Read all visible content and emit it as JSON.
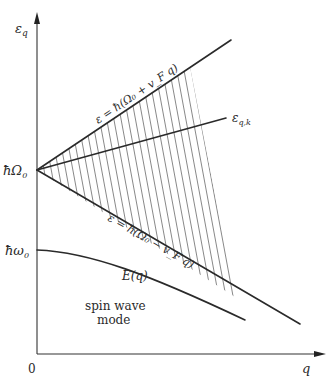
{
  "figure": {
    "type": "energy spectrum diagram",
    "axes": {
      "y_label": "ε_q",
      "x_label": "q",
      "origin_label": "0"
    },
    "y_ticks": [
      {
        "label": "ħΩ₀",
        "y_px": 170
      },
      {
        "label": "ħω₀",
        "y_px": 250
      }
    ],
    "curves": [
      {
        "name": "upper-boundary",
        "label": "ε = ħ(Ω₀ + v_F q)",
        "from": [
          37,
          170
        ],
        "to": [
          231,
          40
        ]
      },
      {
        "name": "eps-qk",
        "label": "ε_{q,k}",
        "from": [
          37,
          170
        ],
        "to": [
          226,
          118
        ]
      },
      {
        "name": "lower-boundary",
        "label": "ε = ħ(Ω₀ − v_F q)",
        "from": [
          37,
          170
        ],
        "to": [
          300,
          324
        ]
      },
      {
        "name": "spin-wave-dispersion",
        "label": "E(q)",
        "from": [
          37,
          250
        ],
        "to": [
          245,
          320
        ]
      }
    ],
    "region_labels": {
      "spin_wave_line1": "spin wave",
      "spin_wave_line2": "mode"
    },
    "hatched_region": "particle-hole continuum between upper and lower boundaries",
    "colors": {
      "line": "#2a2a2a",
      "hatch": "#555555",
      "axis": "#333333"
    }
  },
  "labels": {
    "y_axis": "ε",
    "y_axis_sub": "q",
    "x_axis": "q",
    "origin": "0",
    "hbar_Omega": "ħΩ",
    "hbar_Omega_sub": "0",
    "hbar_omega": "ħω",
    "hbar_omega_sub": "0",
    "eps_qk": "ε",
    "eps_qk_sub": "q,k",
    "upper_eq": "ε = ħ(Ω₀ + v_F q)",
    "lower_eq": "ε = ħ(Ω₀ − v_F q)",
    "E_q": "E(q)",
    "spin_wave": "spin wave",
    "mode": "mode"
  }
}
